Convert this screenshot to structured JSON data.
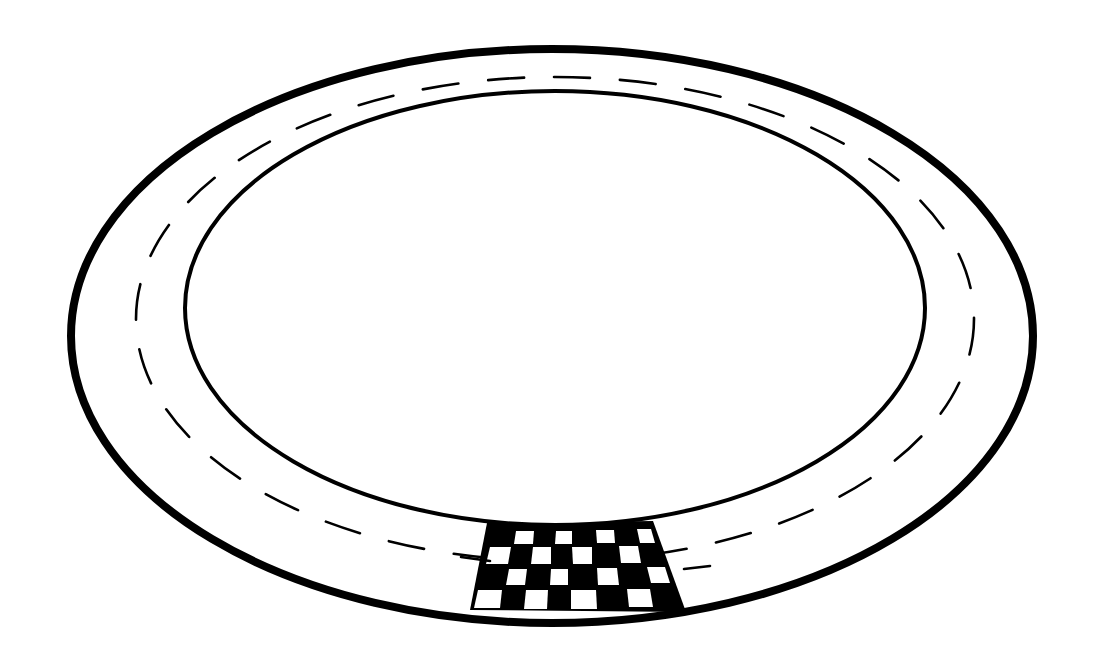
{
  "image": {
    "subject": "race-track-line-art",
    "width": 1097,
    "height": 657,
    "background": "#ffffff",
    "ink": "#000000"
  },
  "track": {
    "outer_edge": {
      "cx": 552,
      "cy": 336,
      "rx": 481,
      "ry": 287,
      "stroke_width": 8
    },
    "inner_edge": {
      "cx": 555,
      "cy": 308,
      "rx": 370,
      "ry": 217,
      "stroke_width": 4
    },
    "center_line": {
      "cx": 555,
      "cy": 319,
      "rx": 419,
      "ry": 242,
      "stroke_width": 2.6,
      "dash": "36 30"
    }
  },
  "finish_line": {
    "label": "checkered-finish-line",
    "polygon": [
      [
        487,
        523
      ],
      [
        653,
        521
      ],
      [
        686,
        612
      ],
      [
        470,
        610
      ]
    ],
    "white_squares": [
      [
        [
          516,
          531
        ],
        [
          534,
          531
        ],
        [
          533,
          544
        ],
        [
          514,
          544
        ]
      ],
      [
        [
          556,
          531
        ],
        [
          572,
          531
        ],
        [
          572,
          544
        ],
        [
          555,
          544
        ]
      ],
      [
        [
          596,
          530
        ],
        [
          614,
          530
        ],
        [
          615,
          543
        ],
        [
          597,
          543
        ]
      ],
      [
        [
          637,
          529
        ],
        [
          651,
          529
        ],
        [
          655,
          543
        ],
        [
          640,
          543
        ]
      ],
      [
        [
          490,
          547
        ],
        [
          511,
          547
        ],
        [
          508,
          564
        ],
        [
          486,
          564
        ]
      ],
      [
        [
          533,
          547
        ],
        [
          551,
          547
        ],
        [
          551,
          564
        ],
        [
          531,
          564
        ]
      ],
      [
        [
          572,
          547
        ],
        [
          592,
          547
        ],
        [
          592,
          564
        ],
        [
          573,
          564
        ]
      ],
      [
        [
          619,
          546
        ],
        [
          638,
          546
        ],
        [
          641,
          563
        ],
        [
          621,
          563
        ]
      ],
      [
        [
          509,
          569
        ],
        [
          527,
          569
        ],
        [
          525,
          585
        ],
        [
          506,
          585
        ]
      ],
      [
        [
          551,
          569
        ],
        [
          568,
          569
        ],
        [
          568,
          585
        ],
        [
          550,
          585
        ]
      ],
      [
        [
          597,
          568
        ],
        [
          617,
          568
        ],
        [
          619,
          585
        ],
        [
          598,
          585
        ]
      ],
      [
        [
          647,
          567
        ],
        [
          665,
          567
        ],
        [
          670,
          583
        ],
        [
          651,
          583
        ]
      ],
      [
        [
          478,
          590
        ],
        [
          502,
          590
        ],
        [
          500,
          608
        ],
        [
          474,
          608
        ]
      ],
      [
        [
          526,
          590
        ],
        [
          548,
          590
        ],
        [
          547,
          609
        ],
        [
          524,
          609
        ]
      ],
      [
        [
          571,
          590
        ],
        [
          596,
          590
        ],
        [
          597,
          609
        ],
        [
          571,
          609
        ]
      ],
      [
        [
          627,
          589
        ],
        [
          650,
          589
        ],
        [
          653,
          607
        ],
        [
          629,
          607
        ]
      ]
    ]
  },
  "lane_ticks": [
    {
      "name": "left-finish-tick",
      "x1": 461,
      "y1": 557,
      "x2": 490,
      "y2": 561
    },
    {
      "name": "right-finish-tick",
      "x1": 684,
      "y1": 569,
      "x2": 710,
      "y2": 566
    }
  ]
}
